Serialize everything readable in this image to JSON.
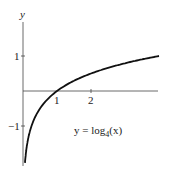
{
  "chart_data": {
    "type": "line",
    "title": "",
    "xlabel": "",
    "ylabel": "y",
    "annotation": "y = log4(x)",
    "annotation_parts": {
      "prefix": "y = log",
      "sub": "4",
      "arg": "(x)"
    },
    "x_ticks": [
      {
        "value": 1,
        "label": "1"
      },
      {
        "value": 2,
        "label": "2"
      }
    ],
    "y_ticks": [
      {
        "value": 1,
        "label": "1"
      },
      {
        "value": -1,
        "label": "−1"
      }
    ],
    "xlim": [
      0,
      4
    ],
    "ylim": [
      -2.1,
      1.5
    ],
    "grid": false,
    "series": [
      {
        "name": "log4(x)",
        "function": "log4(x)",
        "x": [
          0.06,
          0.1,
          0.25,
          0.5,
          1,
          1.5,
          2,
          2.5,
          3,
          3.5,
          4
        ],
        "y": [
          -2.03,
          -1.66,
          -1.0,
          -0.5,
          0,
          0.29,
          0.5,
          0.66,
          0.79,
          0.9,
          1.0
        ]
      }
    ]
  }
}
